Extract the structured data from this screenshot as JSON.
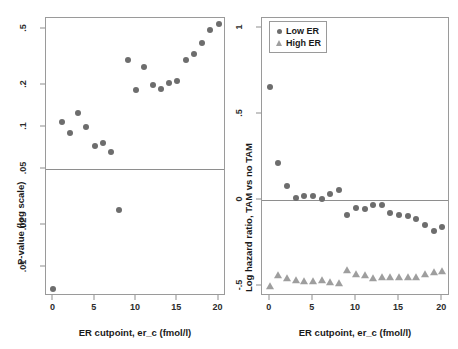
{
  "figure": {
    "panels": [
      {
        "id": "left",
        "xlabel": "ER cutpoint, er_c (fmol/l)",
        "ylabel": "P-value (log scale)"
      },
      {
        "id": "right",
        "xlabel": "ER cutpoint, er_c (fmol/l)",
        "ylabel": "Log hazard ratio, TAM vs no TAM"
      }
    ],
    "legend": {
      "items": [
        {
          "label": "Low ER",
          "marker": "circle-marker",
          "color": "#6d6d6d"
        },
        {
          "label": "High ER",
          "marker": "triangle-marker",
          "color": "#9e9e9e"
        }
      ]
    },
    "colors": {
      "marker_low": "#6d6d6d",
      "marker_high": "#9e9e9e",
      "frame": "#9a9a9a",
      "refline": "#8e8e8e",
      "text": "#1a1a1a"
    }
  },
  "chart_data": [
    {
      "type": "scatter",
      "title": "",
      "xlabel": "ER cutpoint, er_c (fmol/l)",
      "ylabel": "P-value (log scale)",
      "yscale": "log",
      "xlim": [
        -0.9,
        20.9
      ],
      "ylim": [
        0.0062,
        0.6
      ],
      "xticks": [
        0,
        5,
        10,
        15,
        20
      ],
      "xticklabels": [
        "0",
        "5",
        "10",
        "15",
        "20"
      ],
      "yticks": [
        0.5,
        0.2,
        0.1,
        0.05,
        0.02,
        0.01
      ],
      "yticklabels": [
        ".5",
        ".2",
        ".1",
        ".05",
        ".02",
        ".01"
      ],
      "grid": false,
      "legend": "none",
      "reference_lines": [
        {
          "orientation": "horizontal",
          "value": 0.05,
          "label": ".05 significance level"
        }
      ],
      "series": [
        {
          "name": "P-value",
          "marker": "circle",
          "color": "#6d6d6d",
          "x": [
            0,
            1,
            2,
            3,
            4,
            5,
            6,
            7,
            8,
            9,
            10,
            11,
            12,
            13,
            14,
            15,
            16,
            17,
            18,
            19,
            20
          ],
          "y": [
            0.007,
            0.108,
            0.091,
            0.125,
            0.1,
            0.073,
            0.077,
            0.066,
            0.0255,
            0.3,
            0.185,
            0.27,
            0.198,
            0.186,
            0.205,
            0.212,
            0.3,
            0.33,
            0.4,
            0.495,
            0.54
          ]
        }
      ]
    },
    {
      "type": "scatter",
      "title": "",
      "xlabel": "ER cutpoint, er_c (fmol/l)",
      "ylabel": "Log hazard ratio, TAM vs no TAM",
      "yscale": "linear",
      "xlim": [
        -0.9,
        20.9
      ],
      "ylim": [
        -0.56,
        1.06
      ],
      "xticks": [
        0,
        5,
        10,
        15,
        20
      ],
      "xticklabels": [
        "0",
        "5",
        "10",
        "15",
        "20"
      ],
      "yticks": [
        1,
        0.5,
        0,
        -0.5
      ],
      "yticklabels": [
        "1",
        ".5",
        "0",
        "-.5"
      ],
      "grid": false,
      "legend": "upper left",
      "reference_lines": [
        {
          "orientation": "horizontal",
          "value": 0,
          "label": "null effect"
        }
      ],
      "series": [
        {
          "name": "Low ER",
          "marker": "circle",
          "color": "#6d6d6d",
          "x": [
            0,
            1,
            2,
            3,
            4,
            5,
            6,
            7,
            8,
            9,
            10,
            11,
            12,
            13,
            14,
            15,
            16,
            17,
            18,
            19,
            20
          ],
          "y": [
            0.66,
            0.215,
            0.08,
            0.01,
            0.02,
            0.02,
            0.008,
            0.035,
            0.055,
            -0.09,
            -0.045,
            -0.055,
            -0.028,
            -0.03,
            -0.075,
            -0.09,
            -0.095,
            -0.11,
            -0.145,
            -0.18,
            -0.155
          ]
        },
        {
          "name": "High ER",
          "marker": "triangle",
          "color": "#9e9e9e",
          "x": [
            0,
            1,
            2,
            3,
            4,
            5,
            6,
            7,
            8,
            9,
            10,
            11,
            12,
            13,
            14,
            15,
            16,
            17,
            18,
            19,
            20
          ],
          "y": [
            -0.5,
            -0.44,
            -0.455,
            -0.465,
            -0.47,
            -0.47,
            -0.468,
            -0.48,
            -0.482,
            -0.41,
            -0.43,
            -0.44,
            -0.455,
            -0.45,
            -0.45,
            -0.45,
            -0.45,
            -0.448,
            -0.43,
            -0.42,
            -0.415
          ]
        }
      ]
    }
  ]
}
